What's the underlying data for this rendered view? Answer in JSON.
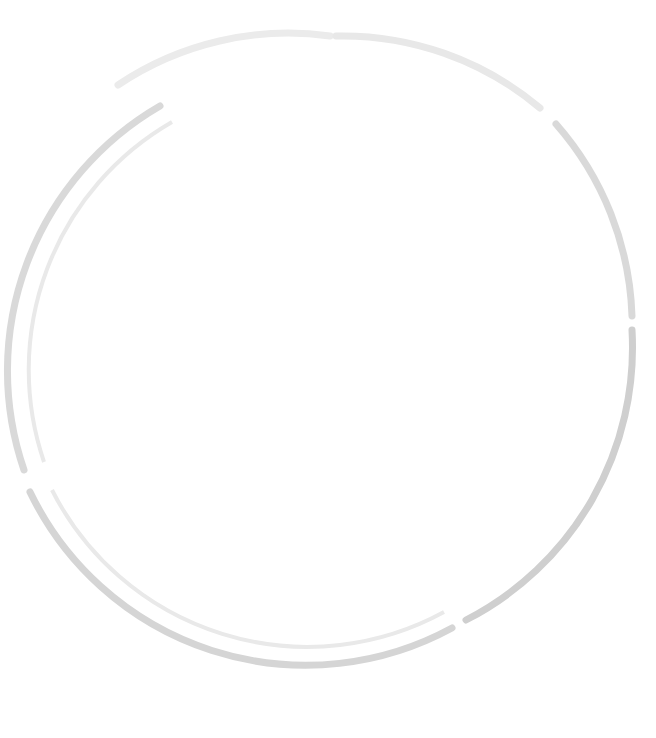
{
  "page": {
    "subtitle": "inflation adjusted",
    "width": 656,
    "height": 738
  },
  "legend": {
    "title": "",
    "items": [
      {
        "label": "Caribbean",
        "color": "#9a9a9a"
      },
      {
        "label": "New Orleans",
        "color": "#e2e2e2"
      }
    ]
  },
  "arcs": [
    {
      "name": "ancient-egypt",
      "label": "ANCIENT EGYPT 500 BC"
    },
    {
      "name": "ancient-rome",
      "label": "ANCIENT ROME 1 BC"
    },
    {
      "name": "slave-trade",
      "label": "SLAVE TRADE 1619-1858"
    },
    {
      "name": "saudi-blood-money",
      "label": "SAUDI 'BLOOD MONEY' PRESENT"
    },
    {
      "name": "modern-war",
      "label": "MODERN WAR 2001-2013"
    },
    {
      "name": "human-trafficking",
      "label": "HUMAN TRAFFICKING 2004-2013"
    }
  ],
  "chart_data": {
    "type": "bubble",
    "subtitle": "inflation adjusted",
    "unit": "USD",
    "eras": [
      "ANCIENT EGYPT 500 BC",
      "ANCIENT ROME 1 BC",
      "SLAVE TRADE 1619-1858",
      "SAUDI 'BLOOD MONEY' PRESENT",
      "MODERN WAR 2001-2013",
      "HUMAN TRAFFICKING 2004-2013"
    ],
    "legend": [
      "Caribbean",
      "New Orleans"
    ],
    "bubbles": [
      {
        "id": "egypt-4500",
        "label": "",
        "value": "$4,500",
        "amount": 4500,
        "cx": 159,
        "cy": 143,
        "r": 25,
        "fill": "#dedede",
        "fig": "seated",
        "figsize": 16,
        "fs": 6.5,
        "era": "ANCIENT EGYPT 500 BC"
      },
      {
        "id": "egypt-man-prime",
        "label": "man in his prime",
        "value": "$32,000",
        "amount": 32000,
        "cx": 123,
        "cy": 230,
        "r": 63,
        "fill": "#dedede",
        "fig": "man",
        "figsize": 62,
        "fs": 10.5,
        "era": "ANCIENT EGYPT 500 BC"
      },
      {
        "id": "rome-30000",
        "label": "",
        "value": "$30,000",
        "amount": 30000,
        "cx": 236,
        "cy": 114,
        "r": 56,
        "fill": "#ebebeb",
        "fig": "man",
        "figsize": 58,
        "fs": 8.5,
        "era": "ANCIENT ROME 1 BC"
      },
      {
        "id": "rome-gladiator",
        "label": "gladiator",
        "value": "$2,000",
        "amount": 2000,
        "cx": 277,
        "cy": 79,
        "r": 19,
        "fill": "#e4e4e4",
        "fig": "man",
        "figsize": 16,
        "fs": 5.5,
        "era": "ANCIENT ROME 1 BC"
      },
      {
        "id": "rome-age25",
        "label": "age\n25",
        "value": "$22,000",
        "amount": 22000,
        "cx": 332,
        "cy": 113,
        "r": 43,
        "fill": "#d6d6d6",
        "fig": "man",
        "figsize": 40,
        "fs": 7.5,
        "era": "ANCIENT ROME 1 BC"
      },
      {
        "id": "rome-age20-40",
        "label": "age\n20\n&40",
        "value": "$11,000",
        "amount": 11000,
        "cx": 330,
        "cy": 196,
        "r": 33,
        "fill": "#cfcfcf",
        "fig": "man",
        "figsize": 34,
        "fs": 6.5,
        "era": "ANCIENT ROME 1 BC"
      },
      {
        "id": "rome-6000",
        "label": "",
        "value": "$6,000",
        "amount": 6000,
        "cx": 210,
        "cy": 198,
        "r": 22,
        "fill": "#ebebeb",
        "fig": "man",
        "figsize": 22,
        "fs": 6.5,
        "era": "ANCIENT ROME 1 BC"
      },
      {
        "id": "rome-12000",
        "label": "",
        "value": "$12,000",
        "amount": 12000,
        "cx": 264,
        "cy": 215,
        "r": 25,
        "fill": "#e3e3e3",
        "fig": "man",
        "figsize": 22,
        "fs": 6.5,
        "era": "ANCIENT ROME 1 BC"
      },
      {
        "id": "rome-man-prime",
        "label": "man in his prime",
        "value": "$30,000",
        "amount": 30000,
        "cx": 412,
        "cy": 116,
        "r": 56,
        "fill": "#dedede",
        "fig": "man",
        "figsize": 58,
        "fs": 9.5,
        "era": "ANCIENT ROME 1 BC"
      },
      {
        "id": "rome-age60",
        "label": "age\n60",
        "value": "$4,000",
        "amount": 4000,
        "cx": 478,
        "cy": 133,
        "r": 24,
        "fill": "#e4e4e4",
        "fig": "man",
        "figsize": 22,
        "fs": 6.0,
        "era": "ANCIENT ROME 1 BC"
      },
      {
        "id": "rome-age8",
        "label": "age\n8",
        "value": "$20,500",
        "amount": 20500,
        "cx": 215,
        "cy": 274,
        "r": 44,
        "fill": "#dedede",
        "fig": "twochild",
        "figsize": 40,
        "fs": 7.5,
        "era": "ANCIENT ROME 1 BC"
      },
      {
        "id": "rome-age10",
        "label": "age\n10",
        "value": "$8,500",
        "amount": 8500,
        "cx": 285,
        "cy": 295,
        "r": 25,
        "fill": "#e3e3e3",
        "fig": "child",
        "figsize": 22,
        "fs": 6.0,
        "era": "ANCIENT ROME 1 BC"
      },
      {
        "id": "rome-age35",
        "label": "age\n35",
        "value": "$19,000",
        "amount": 19000,
        "cx": 405,
        "cy": 228,
        "r": 42,
        "fill": "#e3e3e3",
        "fig": "man",
        "figsize": 38,
        "fs": 7.5,
        "era": "ANCIENT ROME 1 BC"
      },
      {
        "id": "slave-african-13k",
        "label": "African",
        "value": "$13,000",
        "amount": 13000,
        "cx": 351,
        "cy": 204,
        "r": 30,
        "fill": "#b9b9b9",
        "fig": "man",
        "figsize": 28,
        "fs": 6.0,
        "era": "SLAVE TRADE 1619-1858"
      },
      {
        "id": "slave-african-9500",
        "label": "African",
        "value": "$9,500",
        "amount": 9500,
        "cx": 315,
        "cy": 258,
        "r": 30,
        "fill": "#b6b6b6",
        "fig": "man",
        "figsize": 27,
        "fs": 6.0,
        "era": "SLAVE TRADE 1619-1858"
      },
      {
        "id": "slave-african-9000",
        "label": "African",
        "value": "$9,000",
        "amount": 9000,
        "cx": 355,
        "cy": 283,
        "r": 27,
        "fill": "#b0b0b0",
        "fig": "man",
        "figsize": 24,
        "fs": 6.0,
        "era": "SLAVE TRADE 1619-1858"
      },
      {
        "id": "slave-african-10300",
        "label": "African",
        "value": "$10,300",
        "amount": 10300,
        "cx": 312,
        "cy": 355,
        "r": 30,
        "fill": "#a8a8a8",
        "fig": "woman",
        "figsize": 28,
        "fs": 6.0,
        "era": "SLAVE TRADE 1619-1858"
      },
      {
        "id": "slave-irish",
        "label": "Irish",
        "value": "$1,650",
        "amount": 1650,
        "cx": 332,
        "cy": 303,
        "r": 15,
        "fill": "#cdcdcd",
        "fig": "man",
        "figsize": 14,
        "fs": 5.0,
        "era": "SLAVE TRADE 1619-1858"
      },
      {
        "id": "slave-christian-13300",
        "label": "Christian / Jew",
        "value": "$13,300",
        "amount": 13300,
        "cx": 409,
        "cy": 312,
        "r": 33,
        "fill": "#dcdcdc",
        "fig": "man",
        "figsize": 32,
        "fs": 6.0,
        "era": "SAUDI 'BLOOD MONEY' PRESENT"
      },
      {
        "id": "slave-christian-8800",
        "label": "Christian / Jew",
        "value": "$8,800",
        "amount": 8800,
        "cx": 360,
        "cy": 355,
        "r": 27,
        "fill": "#e0e0e0",
        "fig": "man",
        "figsize": 26,
        "fs": 5.5,
        "era": "SAUDI 'BLOOD MONEY' PRESENT"
      },
      {
        "id": "saudi-muslim-27k",
        "label": "Muslim",
        "value": "$27,000",
        "amount": 27000,
        "cx": 494,
        "cy": 203,
        "r": 51,
        "fill": "#d8d8d8",
        "fig": "man",
        "figsize": 50,
        "fs": 9.0,
        "era": "SAUDI 'BLOOD MONEY' PRESENT"
      },
      {
        "id": "saudi-muslim-13500",
        "label": "Muslim",
        "value": "$13,500",
        "amount": 13500,
        "cx": 466,
        "cy": 278,
        "r": 33,
        "fill": "#e0e0e0",
        "fig": "woman",
        "figsize": 32,
        "fs": 6.0,
        "era": "SAUDI 'BLOOD MONEY' PRESENT"
      },
      {
        "id": "saudi-atheist",
        "label": "atheist",
        "value": "$1,750",
        "amount": 1750,
        "cx": 560,
        "cy": 205,
        "r": 17,
        "fill": "#dcdcdc",
        "fig": "man",
        "figsize": 15,
        "fs": 5.0,
        "era": "SAUDI 'BLOOD MONEY' PRESENT"
      },
      {
        "id": "saudi-880",
        "label": "",
        "value": "$880",
        "amount": 880,
        "cx": 579,
        "cy": 240,
        "r": 14,
        "fill": "#dcdcdc",
        "fig": "man",
        "figsize": 13,
        "fs": 5.0,
        "era": "SAUDI 'BLOOD MONEY' PRESENT"
      },
      {
        "id": "war-uk-military",
        "label": "military personnel, UK",
        "value": "death $38,000",
        "amount": 38000,
        "cx": 551,
        "cy": 290,
        "r": 60,
        "fill": "#d0d0d0",
        "fig": "soldiers",
        "figsize": 52,
        "fs": 8.0,
        "era": "MODERN WAR 2001-2013"
      },
      {
        "id": "war-child-soldier-mali",
        "label": "child\nsoldier,\nMali",
        "value": "$600",
        "amount": 600,
        "cx": 442,
        "cy": 322,
        "r": 15,
        "fill": "#dedede",
        "fig": "child",
        "figsize": 13,
        "fs": 4.5,
        "era": "MODERN WAR 2001-2013"
      },
      {
        "id": "war-us-military",
        "label": "military personnel, US",
        "value": "death\n$100,000",
        "amount": 100000,
        "cx": 467,
        "cy": 468,
        "r": 112,
        "fill": "#c4c4c4",
        "fig": "soldiers",
        "figsize": 72,
        "fs": 14.0,
        "era": "MODERN WAR 2001-2013"
      },
      {
        "id": "war-2000-average",
        "label": "",
        "value": "$2,000\n(average)",
        "amount": 2000,
        "cx": 604,
        "cy": 348,
        "r": 18,
        "fill": "#c8c8c8",
        "fig": "none",
        "figsize": 0,
        "fs": 5.0,
        "era": "MODERN WAR 2001-2013"
      },
      {
        "id": "war-afghan-civilian",
        "label": "Afghanistan\ncivilian death,\nby UK military",
        "value": "$8,000\n(highest)",
        "amount": 8000,
        "cx": 600,
        "cy": 403,
        "r": 24,
        "fill": "#c3c3c3",
        "fig": "twoperson",
        "figsize": 14,
        "fs": 4.5,
        "era": "MODERN WAR 2001-2013"
      },
      {
        "id": "war-australian-mil",
        "label": "by\nAustralian\nmilitary",
        "value": "$1,300",
        "amount": 1300,
        "cx": 600,
        "cy": 448,
        "r": 18,
        "fill": "#c3c3c3",
        "fig": "none",
        "figsize": 0,
        "fs": 4.5,
        "era": "MODERN WAR 2001-2013"
      },
      {
        "id": "war-north-caucasus",
        "label": "North Caucasus,\nRussia",
        "value": "$17,500",
        "amount": 17500,
        "cx": 414,
        "cy": 638,
        "r": 41,
        "fill": "#cccccc",
        "fig": "seated",
        "figsize": 24,
        "fs": 8.0,
        "era": "MODERN WAR 2001-2013"
      },
      {
        "id": "war-child-iraq",
        "label": "child, Iraq",
        "value": "$5,500\n(highest)",
        "amount": 5500,
        "cx": 362,
        "cy": 665,
        "r": 22,
        "fill": "#d4d4d4",
        "fig": "child",
        "figsize": 18,
        "fs": 5.0,
        "era": "MODERN WAR 2001-2013"
      },
      {
        "id": "war-burmese-child-soldier",
        "label": "Burmese\nchild soldier",
        "value": "$46",
        "amount": 46,
        "cx": 461,
        "cy": 615,
        "r": 4,
        "fill": "#b9b9b9",
        "fig": "none",
        "figsize": 0,
        "fs": 5.0,
        "era": "MODERN WAR 2001-2013"
      },
      {
        "id": "traf-cambodia",
        "label": "trafficked person,\nCambodia",
        "value": "$45,000",
        "amount": 45000,
        "cx": 91,
        "cy": 386,
        "r": 65,
        "fill": "#dcdcdc",
        "fig": "twoperson",
        "figsize": 56,
        "fs": 9.5,
        "era": "HUMAN TRAFFICKING 2004-2013"
      },
      {
        "id": "traf-thailand",
        "label": "trafficked person,\nThailand",
        "value": "$45,000",
        "amount": 45000,
        "cx": 226,
        "cy": 412,
        "r": 65,
        "fill": "#dcdcdc",
        "fig": "twoperson",
        "figsize": 56,
        "fs": 9.5,
        "era": "HUMAN TRAFFICKING 2004-2013"
      },
      {
        "id": "traf-smuggled-child-uk",
        "label": "smuggled child, UK",
        "value": "$25,000",
        "amount": 25000,
        "cx": 318,
        "cy": 419,
        "r": 46,
        "fill": "#d2d2d2",
        "fig": "child",
        "figsize": 36,
        "fs": 8.5,
        "era": "HUMAN TRAFFICKING 2004-2013"
      },
      {
        "id": "traf-nigerian-40k",
        "label": "Nigerian woman,\nItaly",
        "value": "$40,000 (min)",
        "amount": 40000,
        "cx": 113,
        "cy": 500,
        "r": 58,
        "fill": "#d8d8d8",
        "fig": "woman",
        "figsize": 52,
        "fs": 9.0,
        "era": "HUMAN TRAFFICKING 2004-2013"
      },
      {
        "id": "traf-nigerian-78k",
        "label": "Nigerian woman,\nItaly",
        "value": "$78,000 (max)",
        "amount": 78000,
        "cx": 265,
        "cy": 576,
        "r": 98,
        "fill": "#d0d0d0",
        "fig": "woman",
        "figsize": 68,
        "fs": 14.0,
        "era": "HUMAN TRAFFICKING 2004-2013"
      },
      {
        "id": "traf-girl-romania",
        "label": "girl sold into\nprostitution,\nRomania",
        "value": "$6,000",
        "amount": 6000,
        "cx": 42,
        "cy": 447,
        "r": 22,
        "fill": "#dedede",
        "fig": "woman",
        "figsize": 16,
        "fs": 4.5,
        "era": "HUMAN TRAFFICKING 2004-2013"
      },
      {
        "id": "traf-male-baby-china",
        "label": "male baby,\nChina",
        "value": "$7,800",
        "amount": 7800,
        "cx": 135,
        "cy": 577,
        "r": 25,
        "fill": "#dcdcdc",
        "fig": "seated",
        "figsize": 18,
        "fs": 5.0,
        "era": "HUMAN TRAFFICKING 2004-2013"
      },
      {
        "id": "traf-female-baby-china",
        "label": "female baby,\nChina",
        "value": "$4,700",
        "amount": 4700,
        "cx": 245,
        "cy": 322,
        "r": 22,
        "fill": "#e0e0e0",
        "fig": "seated",
        "figsize": 15,
        "fs": 5.0,
        "era": "HUMAN TRAFFICKING 2004-2013"
      },
      {
        "id": "traf-baby-nigeria",
        "label": "baby, Nigeria",
        "value": "$6,400",
        "amount": 6400,
        "cx": 166,
        "cy": 312,
        "r": 21,
        "fill": "#e0e0e0",
        "fig": "seated",
        "figsize": 15,
        "fs": 5.0,
        "era": "HUMAN TRAFFICKING 2004-2013"
      },
      {
        "id": "traf-burmese-bride",
        "label": "Burmese bride,\nChina",
        "value": "$7,300",
        "amount": 7300,
        "cx": 57,
        "cy": 245,
        "r": 28,
        "fill": "#dcdcdc",
        "fig": "woman",
        "figsize": 24,
        "fs": 5.5,
        "era": "HUMAN TRAFFICKING 2004-2013"
      },
      {
        "id": "traf-40s",
        "label": "40s",
        "value": "$450",
        "amount": 450,
        "cx": 116,
        "cy": 272,
        "r": 16,
        "fill": "#d8d8d8",
        "fig": "none",
        "figsize": 0,
        "fs": 6.5,
        "era": "HUMAN TRAFFICKING 2004-2013"
      },
      {
        "id": "traf-30s",
        "label": "30s",
        "value": "$280",
        "amount": 280,
        "cx": 143,
        "cy": 288,
        "r": 15,
        "fill": "#d4d4d4",
        "fig": "none",
        "figsize": 0,
        "fs": 6.5,
        "era": "HUMAN TRAFFICKING 2004-2013"
      },
      {
        "id": "traf-20s",
        "label": "age\n20s",
        "value": "$1,000",
        "amount": 1000,
        "cx": 178,
        "cy": 276,
        "r": 17,
        "fill": "#d8d8d8",
        "fig": "woman",
        "figsize": 15,
        "fs": 5.0,
        "era": "HUMAN TRAFFICKING 2004-2013"
      },
      {
        "id": "traf-300-lowest",
        "label": "",
        "value": "$300\n(lowest)",
        "amount": 300,
        "cx": 321,
        "cy": 682,
        "r": 14,
        "fill": "#cfcfcf",
        "fig": "none",
        "figsize": 0,
        "fs": 5.0,
        "era": "HUMAN TRAFFICKING 2004-2013"
      }
    ],
    "side_tags": [
      {
        "id": "tag-child-india",
        "text": "child, India\n(for labour,\nsex work)\n$45",
        "x": 14,
        "y": 268,
        "dotx": 44,
        "doty": 300,
        "dotr": 5,
        "dotcolor": "#e0e0e0"
      },
      {
        "id": "tag-north-korea",
        "text": "North Korea",
        "x": 8,
        "y": 592,
        "dotx": 57,
        "doty": 595,
        "dotr": 4,
        "dotcolor": "#c9c9c9"
      },
      {
        "id": "tag-haitian",
        "text": "trafficked Haitian\nimmigrants\n$1,000",
        "x": 62,
        "y": 564,
        "dotx": 108,
        "doty": 560,
        "dotr": 4,
        "dotcolor": "#d8d8d8"
      },
      {
        "id": "tag-brickyards",
        "text": "forced labour in\nillegal brickyards,\nChina\n$78",
        "x": 139,
        "y": 618,
        "dotx": 132,
        "doty": 619,
        "dotr": 5,
        "dotcolor": "#d4d4d4"
      },
      {
        "id": "tag-burmese-soldier",
        "text": "Burmese\nchild soldier\n$46",
        "x": 464,
        "y": 610,
        "dotx": 459,
        "doty": 613,
        "dotr": 4,
        "dotcolor": "#b9b9b9"
      }
    ]
  }
}
